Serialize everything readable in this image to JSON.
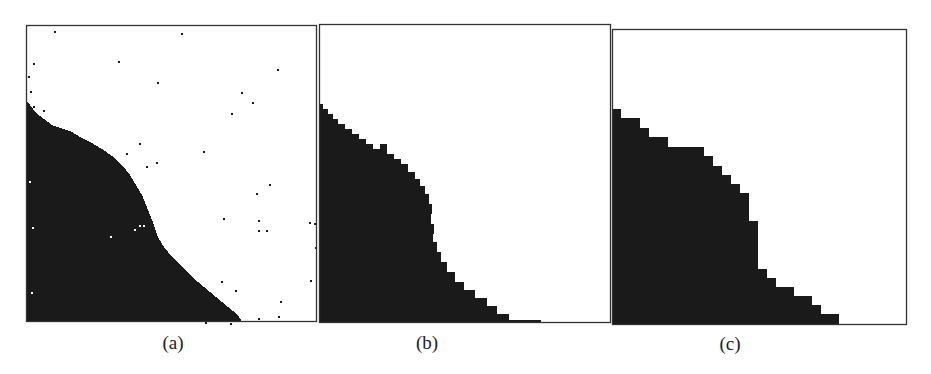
{
  "figure": {
    "background": "#ffffff",
    "ink_color": "#1a1a1a",
    "frame_color": "#333333",
    "panels": [
      {
        "id": "a",
        "caption": "(a)",
        "description": "noisy binary segmentation, full resolution",
        "box": {
          "x": 26,
          "y": 25,
          "w": 291,
          "h": 297
        },
        "caption_pos": {
          "x": 173,
          "y": 333
        },
        "region": [
          [
            0,
            76
          ],
          [
            4,
            80
          ],
          [
            10,
            88
          ],
          [
            18,
            94
          ],
          [
            26,
            100
          ],
          [
            34,
            103
          ],
          [
            44,
            106
          ],
          [
            56,
            113
          ],
          [
            66,
            118
          ],
          [
            76,
            124
          ],
          [
            86,
            131
          ],
          [
            96,
            140
          ],
          [
            104,
            150
          ],
          [
            110,
            160
          ],
          [
            116,
            170
          ],
          [
            120,
            180
          ],
          [
            124,
            190
          ],
          [
            128,
            200
          ],
          [
            132,
            212
          ],
          [
            138,
            222
          ],
          [
            146,
            232
          ],
          [
            156,
            242
          ],
          [
            166,
            252
          ],
          [
            178,
            262
          ],
          [
            190,
            272
          ],
          [
            202,
            282
          ],
          [
            212,
            290
          ],
          [
            216,
            297
          ],
          [
            0,
            297
          ]
        ],
        "noise_dots": [
          [
            28,
            6
          ],
          [
            155,
            8
          ],
          [
            92,
            36
          ],
          [
            7,
            38
          ],
          [
            251,
            44
          ],
          [
            131,
            57
          ],
          [
            215,
            67
          ],
          [
            226,
            77
          ],
          [
            205,
            88
          ],
          [
            2,
            51
          ],
          [
            4,
            66
          ],
          [
            7,
            81
          ],
          [
            17,
            85
          ],
          [
            12,
            92
          ],
          [
            113,
            118
          ],
          [
            177,
            126
          ],
          [
            100,
            128
          ],
          [
            130,
            137
          ],
          [
            120,
            141
          ],
          [
            243,
            159
          ],
          [
            230,
            168
          ],
          [
            197,
            193
          ],
          [
            232,
            195
          ],
          [
            232,
            205
          ],
          [
            240,
            205
          ],
          [
            283,
            197
          ],
          [
            288,
            198
          ],
          [
            289,
            222
          ],
          [
            284,
            255
          ],
          [
            195,
            256
          ],
          [
            209,
            265
          ],
          [
            254,
            276
          ],
          [
            252,
            291
          ],
          [
            232,
            293
          ],
          [
            204,
            298
          ],
          [
            179,
            297
          ],
          [
            3,
            156
          ],
          [
            6,
            202
          ],
          [
            5,
            267
          ],
          [
            108,
            204
          ],
          [
            113,
            200
          ],
          [
            117,
            200
          ],
          [
            88,
            211
          ]
        ],
        "holes": [
          [
            3,
            156
          ],
          [
            6,
            202
          ],
          [
            5,
            267
          ],
          [
            108,
            204
          ],
          [
            113,
            200
          ],
          [
            117,
            200
          ],
          [
            84,
            211
          ]
        ]
      },
      {
        "id": "b",
        "caption": "(b)",
        "description": "coarse block segmentation, medium resolution",
        "box": {
          "x": 319,
          "y": 24,
          "w": 292,
          "h": 299
        },
        "caption_pos": {
          "x": 427,
          "y": 333
        },
        "region": [
          [
            0,
            80
          ],
          [
            4,
            80
          ],
          [
            4,
            85
          ],
          [
            9,
            85
          ],
          [
            9,
            90
          ],
          [
            14,
            90
          ],
          [
            14,
            95
          ],
          [
            19,
            95
          ],
          [
            19,
            100
          ],
          [
            26,
            100
          ],
          [
            26,
            105
          ],
          [
            33,
            105
          ],
          [
            33,
            110
          ],
          [
            40,
            110
          ],
          [
            40,
            115
          ],
          [
            47,
            115
          ],
          [
            47,
            120
          ],
          [
            54,
            120
          ],
          [
            54,
            125
          ],
          [
            61,
            125
          ],
          [
            61,
            120
          ],
          [
            68,
            120
          ],
          [
            68,
            130
          ],
          [
            75,
            130
          ],
          [
            75,
            135
          ],
          [
            82,
            135
          ],
          [
            82,
            140
          ],
          [
            89,
            140
          ],
          [
            89,
            148
          ],
          [
            96,
            148
          ],
          [
            96,
            155
          ],
          [
            101,
            155
          ],
          [
            101,
            162
          ],
          [
            106,
            162
          ],
          [
            106,
            170
          ],
          [
            110,
            170
          ],
          [
            110,
            180
          ],
          [
            113,
            180
          ],
          [
            113,
            190
          ],
          [
            112,
            190
          ],
          [
            112,
            200
          ],
          [
            115,
            200
          ],
          [
            115,
            210
          ],
          [
            114,
            210
          ],
          [
            114,
            218
          ],
          [
            118,
            218
          ],
          [
            118,
            228
          ],
          [
            122,
            228
          ],
          [
            122,
            238
          ],
          [
            128,
            238
          ],
          [
            128,
            248
          ],
          [
            136,
            248
          ],
          [
            136,
            258
          ],
          [
            145,
            258
          ],
          [
            145,
            266
          ],
          [
            156,
            266
          ],
          [
            156,
            274
          ],
          [
            168,
            274
          ],
          [
            168,
            282
          ],
          [
            178,
            282
          ],
          [
            178,
            290
          ],
          [
            190,
            290
          ],
          [
            190,
            296
          ],
          [
            222,
            296
          ],
          [
            222,
            299
          ],
          [
            0,
            299
          ]
        ],
        "noise_dots": [],
        "holes": []
      },
      {
        "id": "c",
        "caption": "(c)",
        "description": "coarser block segmentation, low resolution",
        "box": {
          "x": 612,
          "y": 29,
          "w": 295,
          "h": 296
        },
        "caption_pos": {
          "x": 730,
          "y": 334
        },
        "region": [
          [
            0,
            80
          ],
          [
            9,
            80
          ],
          [
            9,
            89
          ],
          [
            28,
            89
          ],
          [
            28,
            99
          ],
          [
            37,
            99
          ],
          [
            37,
            108
          ],
          [
            56,
            108
          ],
          [
            56,
            118
          ],
          [
            92,
            118
          ],
          [
            92,
            127
          ],
          [
            101,
            127
          ],
          [
            101,
            137
          ],
          [
            110,
            137
          ],
          [
            110,
            146
          ],
          [
            119,
            146
          ],
          [
            119,
            155
          ],
          [
            128,
            155
          ],
          [
            128,
            164
          ],
          [
            137,
            164
          ],
          [
            137,
            192
          ],
          [
            146,
            192
          ],
          [
            146,
            240
          ],
          [
            155,
            240
          ],
          [
            155,
            249
          ],
          [
            164,
            249
          ],
          [
            164,
            258
          ],
          [
            182,
            258
          ],
          [
            182,
            267
          ],
          [
            200,
            267
          ],
          [
            200,
            276
          ],
          [
            209,
            276
          ],
          [
            209,
            285
          ],
          [
            227,
            285
          ],
          [
            227,
            296
          ],
          [
            0,
            296
          ]
        ],
        "noise_dots": [],
        "holes": []
      }
    ]
  }
}
